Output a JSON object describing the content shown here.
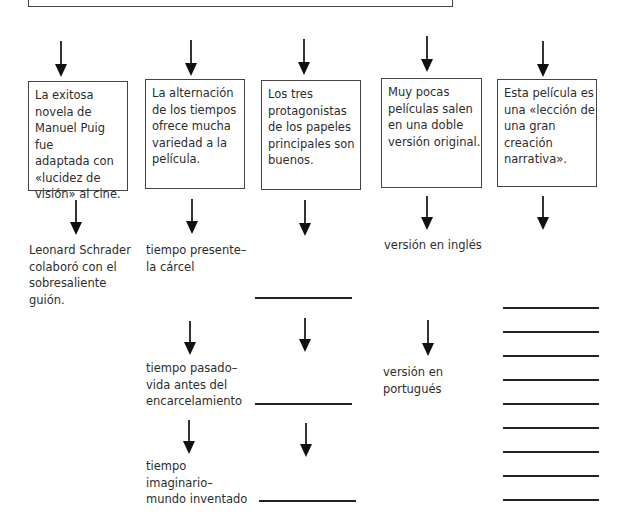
{
  "top_box": {
    "text": ""
  },
  "columns": [
    {
      "box": {
        "lines": [
          "La exitosa",
          "novela de",
          "Manuel Puig fue",
          "adaptada con",
          "«lucidez de",
          "visión» al cine."
        ]
      },
      "details": [
        {
          "lines": [
            "Leonard Schrader",
            "colaboró con el",
            "sobresaliente",
            "guión."
          ]
        }
      ]
    },
    {
      "box": {
        "lines": [
          "La alternación",
          "de los tiempos",
          "ofrece mucha",
          "variedad a la",
          "película."
        ]
      },
      "details": [
        {
          "lines": [
            "tiempo presente–",
            "la cárcel"
          ]
        },
        {
          "lines": [
            "tiempo pasado–",
            "vida antes del",
            "encarcelamiento"
          ]
        },
        {
          "lines": [
            "tiempo",
            "imaginario–",
            "mundo inventado"
          ]
        }
      ]
    },
    {
      "box": {
        "lines": [
          "Los tres",
          "protagonistas",
          "de los papeles",
          "principales son",
          "buenos."
        ]
      },
      "details": [
        {
          "blank": true
        },
        {
          "blank": true
        },
        {
          "blank": true
        }
      ]
    },
    {
      "box": {
        "lines": [
          "Muy pocas",
          "películas salen",
          "en una doble",
          "versión original."
        ]
      },
      "details": [
        {
          "lines": [
            "versión en inglés"
          ]
        },
        {
          "lines": [
            "versión en",
            "portugués"
          ]
        }
      ]
    },
    {
      "box": {
        "lines": [
          "Esta película es",
          "una «lección de",
          "una gran",
          "creación",
          "narrativa»."
        ]
      },
      "details": [
        {
          "blank_lines": 9
        }
      ]
    }
  ]
}
